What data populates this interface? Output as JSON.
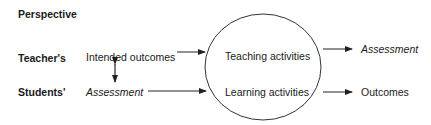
{
  "diagram": {
    "heading": "Perspective",
    "rows": [
      {
        "label": "Teacher's",
        "input": "Intended outcomes",
        "input_italic": false,
        "activity": "Teaching activities",
        "output": "Assessment",
        "output_italic": true
      },
      {
        "label": "Students'",
        "input": "Assessment",
        "input_italic": true,
        "activity": "Learning activities",
        "output": "Outcomes",
        "output_italic": false
      }
    ],
    "connector": "bidirectional-arrow between Intended outcomes and Assessment",
    "shape": "ellipse enclosing Teaching activities and Learning activities",
    "colors": {
      "text": "#1a1a1a",
      "stroke": "#333333",
      "background": "#ffffff"
    }
  }
}
